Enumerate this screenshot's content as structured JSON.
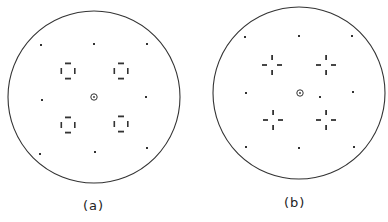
{
  "figure": {
    "panels": [
      {
        "id": "a",
        "label": "(a)",
        "circle": {
          "cx": 94,
          "cy": 97,
          "r": 86
        },
        "center_marker": {
          "x": 94,
          "y": 97
        },
        "outer_spots": [
          [
            41,
            45
          ],
          [
            94,
            44
          ],
          [
            147,
            44
          ],
          [
            42,
            100
          ],
          [
            146,
            97
          ],
          [
            40,
            154
          ],
          [
            95,
            152
          ],
          [
            147,
            148
          ]
        ],
        "quad_groups": [
          {
            "x": 68,
            "y": 71,
            "pattern": "square-ring"
          },
          {
            "x": 121,
            "y": 71,
            "pattern": "square-ring"
          },
          {
            "x": 68,
            "y": 125,
            "pattern": "square-ring"
          },
          {
            "x": 121,
            "y": 124,
            "pattern": "square-ring"
          }
        ]
      },
      {
        "id": "b",
        "label": "(b)",
        "circle": {
          "cx": 299,
          "cy": 93,
          "r": 86
        },
        "center_marker": {
          "x": 300,
          "y": 93
        },
        "outer_spots": [
          [
            245,
            37
          ],
          [
            299,
            36
          ],
          [
            352,
            36
          ],
          [
            246,
            93
          ],
          [
            353,
            92
          ],
          [
            246,
            147
          ],
          [
            299,
            148
          ],
          [
            354,
            147
          ],
          [
            320,
            97
          ]
        ],
        "quad_groups": [
          {
            "x": 272,
            "y": 65,
            "pattern": "cross"
          },
          {
            "x": 326,
            "y": 65,
            "pattern": "cross"
          },
          {
            "x": 273,
            "y": 120,
            "pattern": "cross"
          },
          {
            "x": 326,
            "y": 120,
            "pattern": "cross"
          }
        ]
      }
    ],
    "captions": {
      "a": "(a)",
      "b": "(b)"
    },
    "colors": {
      "stroke": "#333333",
      "background": "#ffffff"
    }
  }
}
